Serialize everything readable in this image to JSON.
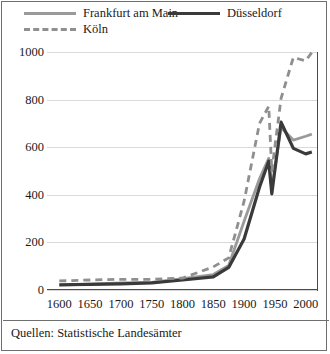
{
  "caption": "Quellen: Statistische Landesämter",
  "legend": {
    "items": [
      {
        "label": "Frankfurt am Main",
        "style": "solid",
        "color": "#9a9a9a"
      },
      {
        "label": "Düsseldorf",
        "style": "solid",
        "color": "#3a3a3a"
      },
      {
        "label": "Köln",
        "style": "dashed",
        "color": "#8f8f8f"
      }
    ]
  },
  "chart_data": {
    "type": "line",
    "title": "",
    "xlabel": "",
    "ylabel": "",
    "xlim": [
      1580,
      2020
    ],
    "ylim": [
      0,
      1000
    ],
    "xticks": [
      1600,
      1650,
      1700,
      1750,
      1800,
      1850,
      1900,
      1950,
      2000
    ],
    "yticks": [
      0,
      200,
      400,
      600,
      800,
      1000
    ],
    "grid": true,
    "legend_position": "top",
    "x": [
      1600,
      1650,
      1700,
      1750,
      1800,
      1850,
      1875,
      1900,
      1925,
      1940,
      1945,
      1960,
      1980,
      2000,
      2010
    ],
    "series": [
      {
        "name": "Frankfurt am Main",
        "color": "#9a9a9a",
        "style": "solid",
        "values": [
          20,
          25,
          30,
          32,
          48,
          65,
          103,
          289,
          467,
          553,
          424,
          683,
          630,
          646,
          655
        ]
      },
      {
        "name": "Düsseldorf",
        "color": "#3a3a3a",
        "style": "solid",
        "values": [
          22,
          24,
          26,
          30,
          42,
          55,
          95,
          214,
          432,
          541,
          404,
          705,
          595,
          572,
          580
        ]
      },
      {
        "name": "Köln",
        "color": "#8f8f8f",
        "style": "dashed",
        "values": [
          38,
          42,
          45,
          45,
          50,
          97,
          135,
          373,
          700,
          772,
          500,
          805,
          977,
          963,
          998
        ]
      }
    ]
  }
}
